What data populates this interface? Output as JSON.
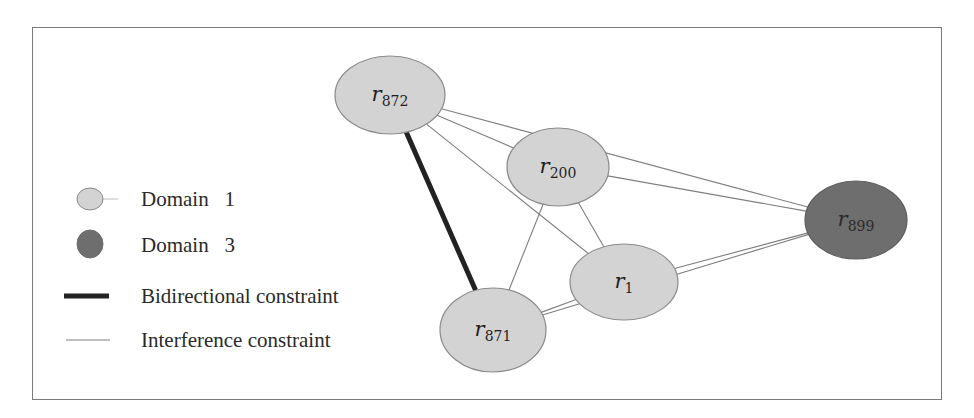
{
  "figure": {
    "colors": {
      "domain1_fill": "#d3d3d3",
      "domain3_fill": "#6e6e6e",
      "node_stroke": "#8a8a8a",
      "interference_line": "#7f7f7f",
      "bidirectional_line": "#222222",
      "frame": "#7a7a7a"
    },
    "legend": {
      "items": [
        {
          "id": "domain1",
          "label": "Domain   1",
          "symbol": "light-ellipse"
        },
        {
          "id": "domain3",
          "label": "Domain   3",
          "symbol": "dark-ellipse"
        },
        {
          "id": "bidirectional",
          "label": "Bidirectional constraint",
          "symbol": "thick-line"
        },
        {
          "id": "interference",
          "label": "Interference constraint",
          "symbol": "thin-line"
        }
      ]
    },
    "nodes": [
      {
        "id": "r872",
        "base": "r",
        "sub": "872",
        "domain": "Domain 1",
        "cx": 390,
        "cy": 95,
        "rx": 55,
        "ry": 39
      },
      {
        "id": "r200",
        "base": "r",
        "sub": "200",
        "domain": "Domain 1",
        "cx": 558,
        "cy": 167,
        "rx": 51,
        "ry": 39
      },
      {
        "id": "r1",
        "base": "r",
        "sub": "1",
        "domain": "Domain 1",
        "cx": 624,
        "cy": 282,
        "rx": 54,
        "ry": 38
      },
      {
        "id": "r871",
        "base": "r",
        "sub": "871",
        "domain": "Domain 1",
        "cx": 493,
        "cy": 330,
        "rx": 53,
        "ry": 42
      },
      {
        "id": "r899",
        "base": "r",
        "sub": "899",
        "domain": "Domain 3",
        "cx": 856,
        "cy": 220,
        "rx": 51,
        "ry": 39
      }
    ],
    "edges": [
      {
        "from": "r872",
        "to": "r871",
        "type": "bidirectional"
      },
      {
        "from": "r872",
        "to": "r899",
        "type": "interference"
      },
      {
        "from": "r872",
        "to": "r200",
        "type": "interference"
      },
      {
        "from": "r872",
        "to": "r1",
        "type": "interference"
      },
      {
        "from": "r200",
        "to": "r899",
        "type": "interference"
      },
      {
        "from": "r200",
        "to": "r871",
        "type": "interference"
      },
      {
        "from": "r200",
        "to": "r1",
        "type": "interference"
      },
      {
        "from": "r1",
        "to": "r899",
        "type": "interference"
      },
      {
        "from": "r1",
        "to": "r871",
        "type": "interference"
      },
      {
        "from": "r871",
        "to": "r899",
        "type": "interference"
      }
    ]
  }
}
